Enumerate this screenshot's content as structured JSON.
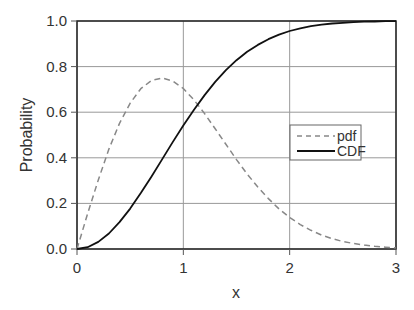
{
  "chart_data": {
    "type": "line",
    "title": "",
    "xlabel": "x",
    "ylabel": "Probability",
    "xlim": [
      0,
      3
    ],
    "ylim": [
      0,
      1.0
    ],
    "x_ticks": [
      "0",
      "1",
      "2",
      "3"
    ],
    "y_ticks": [
      "0.0",
      "0.2",
      "0.4",
      "0.6",
      "0.8",
      "1.0"
    ],
    "grid": true,
    "legend_position": "right-middle",
    "x": [
      0,
      0.1,
      0.2,
      0.3,
      0.4,
      0.5,
      0.6,
      0.7,
      0.8,
      0.9,
      1.0,
      1.1,
      1.2,
      1.3,
      1.4,
      1.5,
      1.6,
      1.7,
      1.8,
      1.9,
      2.0,
      2.1,
      2.2,
      2.3,
      2.4,
      2.5,
      2.6,
      2.7,
      2.8,
      2.9,
      3.0
    ],
    "series": [
      {
        "name": "pdf",
        "style": "dashed",
        "color": "#888888",
        "values": [
          0.0,
          0.155,
          0.303,
          0.438,
          0.551,
          0.64,
          0.703,
          0.739,
          0.75,
          0.737,
          0.704,
          0.654,
          0.594,
          0.527,
          0.459,
          0.392,
          0.329,
          0.272,
          0.221,
          0.176,
          0.138,
          0.107,
          0.082,
          0.061,
          0.045,
          0.033,
          0.024,
          0.017,
          0.012,
          0.008,
          0.005
        ]
      },
      {
        "name": "CDF",
        "style": "solid",
        "color": "#111111",
        "values": [
          0.0,
          0.008,
          0.031,
          0.068,
          0.118,
          0.177,
          0.245,
          0.317,
          0.393,
          0.469,
          0.542,
          0.611,
          0.675,
          0.733,
          0.784,
          0.828,
          0.865,
          0.895,
          0.92,
          0.94,
          0.956,
          0.968,
          0.977,
          0.984,
          0.989,
          0.992,
          0.995,
          0.997,
          0.998,
          0.999,
          0.999
        ]
      }
    ]
  },
  "legend": {
    "pdf_label": "pdf",
    "cdf_label": "CDF"
  },
  "axes": {
    "xlabel": "x",
    "ylabel": "Probability"
  }
}
